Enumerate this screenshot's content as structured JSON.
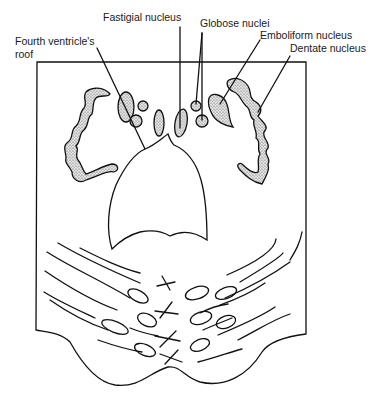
{
  "diagram": {
    "title": "",
    "labels": {
      "fastigial": "Fastigial nucleus",
      "globose": "Globose nuclei",
      "emboliform": "Emboliform nucleus",
      "dentate": "Dentate nucleus",
      "roof_line1": "Fourth ventricle's",
      "roof_line2": "roof"
    },
    "colors": {
      "line": "#111111",
      "background": "#ffffff"
    }
  }
}
